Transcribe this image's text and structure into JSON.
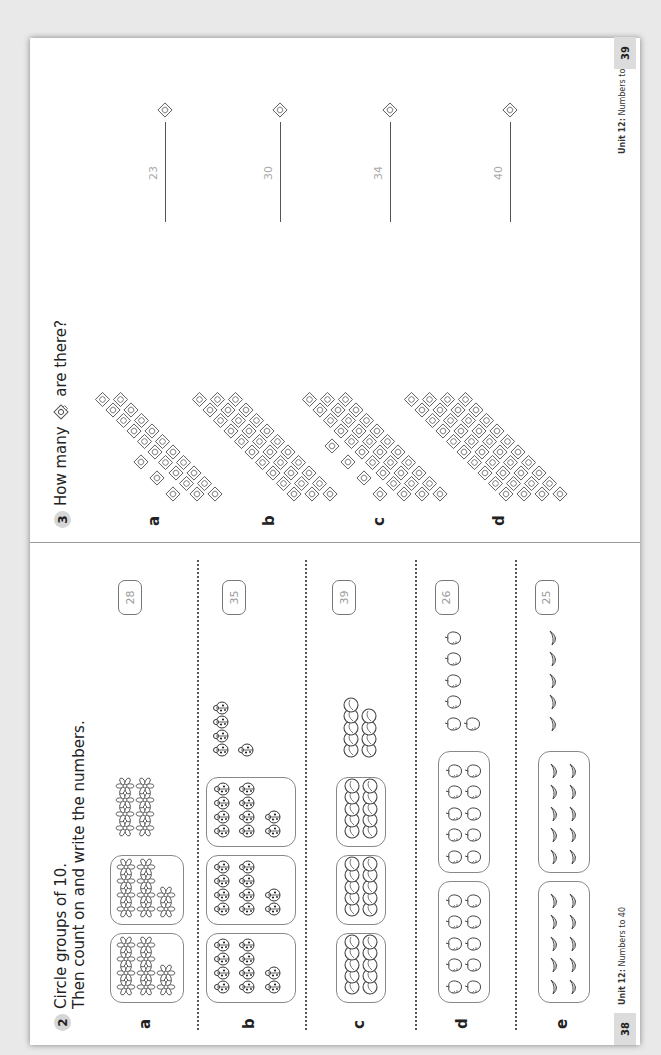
{
  "left_page": {
    "question_number": "2",
    "instruction_line1": "Circle groups of 10.",
    "instruction_line2": "Then count on and write the numbers.",
    "items": [
      {
        "letter": "a",
        "object": "flower",
        "groups_of_ten": 2,
        "loose": 8,
        "answer": "28"
      },
      {
        "letter": "b",
        "object": "ladybird",
        "groups_of_ten": 3,
        "loose": 5,
        "answer": "35"
      },
      {
        "letter": "c",
        "object": "marble",
        "groups_of_ten": 3,
        "loose": 9,
        "answer": "39"
      },
      {
        "letter": "d",
        "object": "apple",
        "groups_of_ten": 2,
        "loose": 6,
        "answer": "26"
      },
      {
        "letter": "e",
        "object": "banana",
        "groups_of_ten": 2,
        "loose": 5,
        "answer": "25"
      }
    ],
    "footer_unit": "Unit 12:",
    "footer_title": "Numbers to 40",
    "page_number": "38"
  },
  "right_page": {
    "question_number": "3",
    "question_prefix": "How many",
    "question_suffix": "are there?",
    "items": [
      {
        "letter": "a",
        "sticks_of_ten": 2,
        "ones": 3,
        "answer": "23"
      },
      {
        "letter": "b",
        "sticks_of_ten": 3,
        "ones": 0,
        "answer": "30"
      },
      {
        "letter": "c",
        "sticks_of_ten": 3,
        "ones": 4,
        "answer": "34"
      },
      {
        "letter": "d",
        "sticks_of_ten": 4,
        "ones": 0,
        "answer": "40"
      }
    ],
    "footer_unit": "Unit 12:",
    "footer_title": "Numbers to 40",
    "page_number": "39"
  }
}
